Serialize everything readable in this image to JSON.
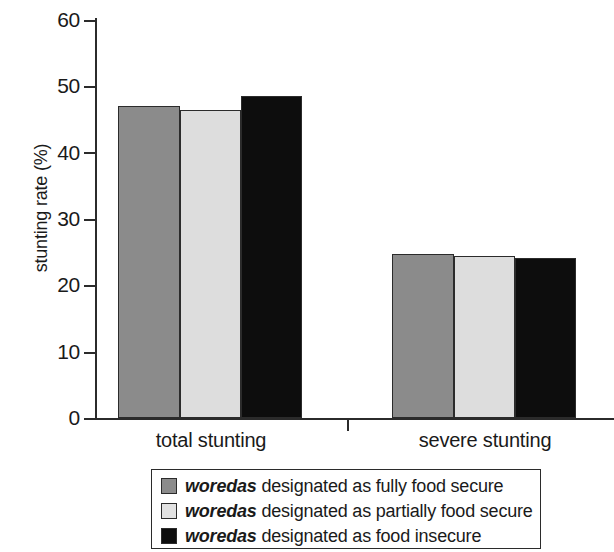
{
  "chart_data": {
    "type": "bar",
    "title": "",
    "xlabel": "",
    "ylabel": "stunting rate (%)",
    "categories": [
      "total stunting",
      "severe stunting"
    ],
    "ylim": [
      0,
      60
    ],
    "yticks": [
      0,
      10,
      20,
      30,
      40,
      50,
      60
    ],
    "ytick_labels": [
      "0",
      "10",
      "20",
      "30",
      "40",
      "50",
      "60"
    ],
    "grid": false,
    "legend_position": "bottom",
    "series": [
      {
        "name": "woredas designated as fully food secure",
        "color": "#8b8b8b",
        "values": [
          47.0,
          24.7
        ]
      },
      {
        "name": "woredas designated as partially food secure",
        "color": "#dddddd",
        "values": [
          46.5,
          24.4
        ]
      },
      {
        "name": "woredas designated as food insecure",
        "color": "#0d0d0d",
        "values": [
          48.5,
          24.1
        ]
      }
    ]
  },
  "axes": {
    "y_title": "stunting rate (%)",
    "y_tick_labels": [
      "60",
      "50",
      "40",
      "30",
      "20",
      "10",
      "0"
    ],
    "x_categories": [
      "total stunting",
      "severe stunting"
    ]
  },
  "legend": {
    "items": [
      {
        "emphasis": "woredas",
        "rest": " designated as fully food secure",
        "swatch": "legend-swatch-fully-food-secure"
      },
      {
        "emphasis": "woredas",
        "rest": " designated as partially food secure",
        "swatch": "legend-swatch-partially-food-secure"
      },
      {
        "emphasis": "woredas",
        "rest": " designated as food insecure",
        "swatch": "legend-swatch-food-insecure"
      }
    ]
  }
}
